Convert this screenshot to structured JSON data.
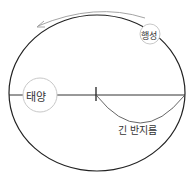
{
  "diagram": {
    "sun": {
      "label": "태양"
    },
    "planet": {
      "label": "행성"
    },
    "semi_major_axis": {
      "label": "긴 반지름"
    },
    "direction_arrow": {
      "direction": "counterclockwise"
    },
    "colors": {
      "orbit": "#222222",
      "arrow": "#9a9a9a",
      "body_outline": "#c8c8c8",
      "arc": "#555555",
      "text": "#333333"
    }
  }
}
